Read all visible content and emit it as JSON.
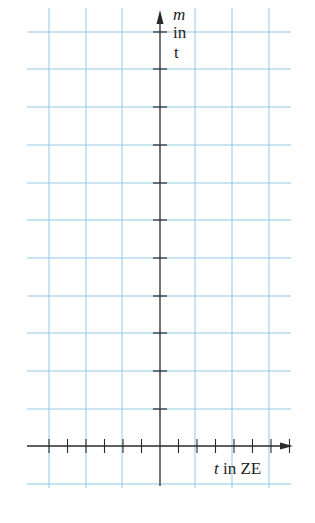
{
  "diagram": {
    "type": "coordinate-grid",
    "colors": {
      "grid": "#8ec9e4",
      "axis": "#2a2a2a",
      "background": "#ffffff"
    },
    "y_axis": {
      "variable": "m",
      "label_line1": "m",
      "label_line2": "in",
      "label_line3": "t",
      "tick_count": 11
    },
    "x_axis": {
      "variable": "t",
      "label_var": "t",
      "label_unit": "in ZE",
      "ticks_left_of_origin": 6,
      "ticks_right_of_origin": 7
    },
    "grid": {
      "vertical_lines_x": [
        49,
        86,
        122,
        160,
        195,
        232,
        269
      ],
      "horizontal_lines_y": [
        32,
        69,
        107,
        145,
        183,
        220,
        258,
        296,
        333,
        371,
        409,
        446,
        484
      ]
    }
  }
}
